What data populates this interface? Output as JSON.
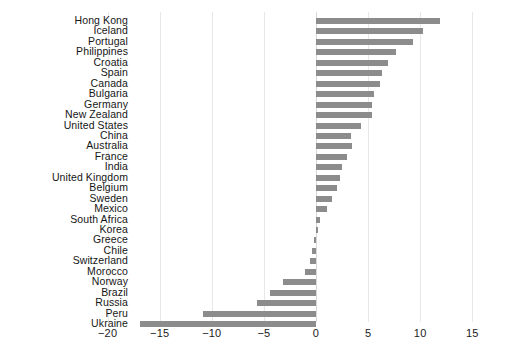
{
  "chart_data": {
    "type": "bar",
    "orientation": "horizontal",
    "title": "",
    "subtitle": "",
    "xlabel": "",
    "ylabel": "",
    "xlim": [
      -20,
      15
    ],
    "ylim": null,
    "grid": true,
    "legend": null,
    "bar_color": "#8c8c8c",
    "axis_text_color": "#1a1a1a",
    "xticks": [
      -20,
      -15,
      -10,
      -5,
      0,
      5,
      10,
      15
    ],
    "xtick_labels": [
      "−20",
      "−15",
      "−10",
      "−5",
      "0",
      "5",
      "10",
      "15"
    ],
    "categories": [
      "Hong Kong",
      "Iceland",
      "Portugal",
      "Philippines",
      "Croatia",
      "Spain",
      "Canada",
      "Bulgaria",
      "Germany",
      "New Zealand",
      "United States",
      "China",
      "Australia",
      "France",
      "India",
      "United Kingdom",
      "Belgium",
      "Sweden",
      "Mexico",
      "South Africa",
      "Korea",
      "Greece",
      "Chile",
      "Switzerland",
      "Morocco",
      "Norway",
      "Brazil",
      "Russia",
      "Peru",
      "Ukraine"
    ],
    "values": [
      11.9,
      10.3,
      9.3,
      7.7,
      6.9,
      6.3,
      6.1,
      5.6,
      5.4,
      5.4,
      4.3,
      3.4,
      3.5,
      3.0,
      2.5,
      2.3,
      2.0,
      1.5,
      1.1,
      0.4,
      0.2,
      -0.2,
      -0.4,
      -0.6,
      -1.1,
      -3.2,
      -4.4,
      -5.7,
      -10.8,
      -16.9
    ]
  }
}
